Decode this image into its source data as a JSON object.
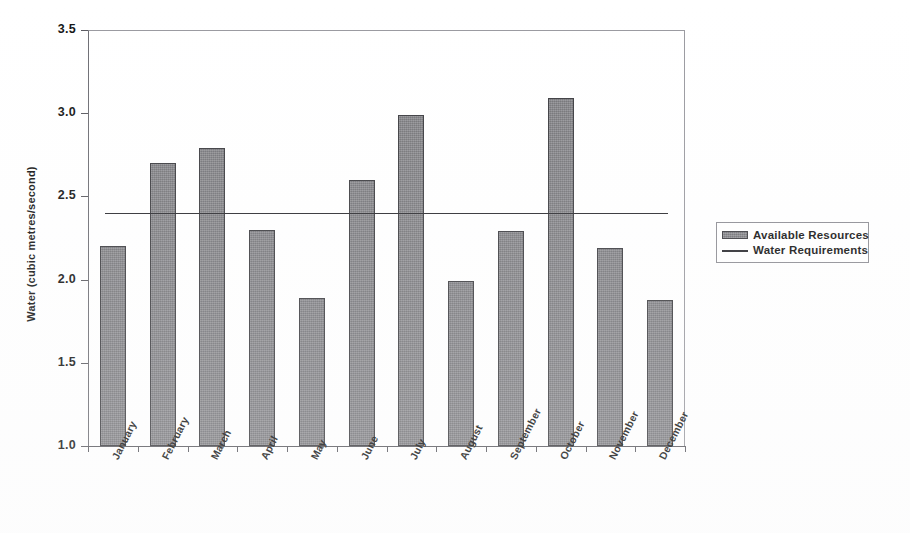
{
  "chart_data": {
    "type": "bar",
    "title": "",
    "xlabel": "",
    "ylabel": "Water (cubic metres/second)",
    "ylim": [
      1.0,
      3.5
    ],
    "yticks": [
      "1.0",
      "1.5",
      "2.0",
      "2.5",
      "3.0",
      "3.5"
    ],
    "grid": false,
    "legend_position": "right",
    "categories": [
      "January",
      "February",
      "March",
      "April",
      "May",
      "June",
      "July",
      "August",
      "September",
      "October",
      "November",
      "December"
    ],
    "series": [
      {
        "name": "Available Resources",
        "type": "bar",
        "color": "#818185",
        "values": [
          2.2,
          2.7,
          2.79,
          2.3,
          1.89,
          2.6,
          2.99,
          1.99,
          2.29,
          3.09,
          2.19,
          1.88
        ]
      },
      {
        "name": "Water Requirements",
        "type": "line",
        "color": "#2b2b2f",
        "constant_value": 2.4,
        "values": [
          2.4,
          2.4,
          2.4,
          2.4,
          2.4,
          2.4,
          2.4,
          2.4,
          2.4,
          2.4,
          2.4,
          2.4
        ]
      }
    ]
  },
  "legend": {
    "entries": [
      {
        "label": "Available Resources",
        "swatch": "bar-swatch"
      },
      {
        "label": "Water Requirements",
        "swatch": "line-swatch"
      }
    ]
  }
}
